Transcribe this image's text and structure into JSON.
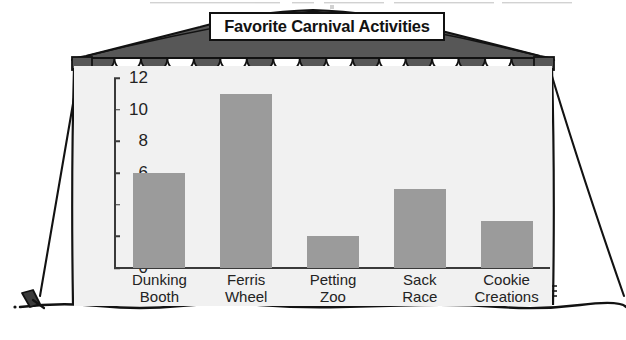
{
  "page": {
    "top_cut_text": "",
    "background_color": "#ffffff"
  },
  "tent": {
    "roof_color": "#575757",
    "scallop_dark_color": "#575757",
    "scallop_light_color": "#ffffff",
    "outline_color": "#121212",
    "ground_line_color": "#121212",
    "stake_color": "#2a2a2a",
    "panel_color": "#f1f1f1",
    "scallop_count": 17
  },
  "title": {
    "text": "Favorite Carnival Activities",
    "banner_fill": "#ffffff",
    "banner_border": "#111111"
  },
  "chart_data": {
    "type": "bar",
    "title": "Favorite Carnival Activities",
    "xlabel": "",
    "ylabel": "",
    "categories": [
      "Dunking Booth",
      "Ferris Wheel",
      "Petting Zoo",
      "Sack Race",
      "Cookie Creations"
    ],
    "category_lines": [
      [
        "Dunking",
        "Booth"
      ],
      [
        "Ferris",
        "Wheel"
      ],
      [
        "Petting",
        "Zoo"
      ],
      [
        "Sack",
        "Race"
      ],
      [
        "Cookie",
        "Creations"
      ]
    ],
    "values": [
      6,
      11,
      2,
      5,
      3
    ],
    "ylim": [
      0,
      12
    ],
    "yticks": [
      0,
      2,
      4,
      6,
      8,
      10,
      12
    ],
    "ytick_labels": [
      "0",
      "2",
      "4",
      "6",
      "8",
      "10",
      "12"
    ],
    "grid": false,
    "legend": false,
    "bar_color": "#9b9b9b",
    "plot_background": "#f1f1f1",
    "axis_color": "#3a3a3a"
  }
}
